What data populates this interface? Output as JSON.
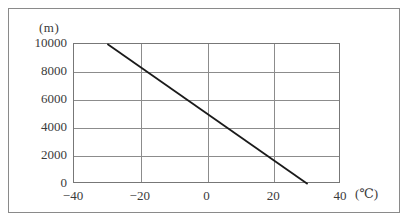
{
  "chart_data": {
    "type": "line",
    "title": "",
    "subtitle": "",
    "xlabel": "(℃)",
    "ylabel": "(m)",
    "xlim": [
      -40,
      40
    ],
    "ylim": [
      0,
      10000
    ],
    "xticks": [
      -40,
      -20,
      0,
      20,
      40
    ],
    "xtick_labels": [
      "−40",
      "−20",
      "0",
      "20",
      "40"
    ],
    "yticks": [
      0,
      2000,
      4000,
      6000,
      8000,
      10000
    ],
    "ytick_labels": [
      "0",
      "2000",
      "4000",
      "6000",
      "8000",
      "10000"
    ],
    "grid": true,
    "legend": null,
    "series": [
      {
        "name": "altitude-temperature",
        "color": "#1a1a1a",
        "points": [
          {
            "x": -30,
            "y": 10000
          },
          {
            "x": 30,
            "y": 0
          }
        ]
      }
    ],
    "annotations": []
  },
  "axes": {
    "y_unit_caption": "(m)",
    "x_unit_caption": "(℃)"
  },
  "colors": {
    "line": "#1a1a1a",
    "grid": "#8c8c8c",
    "plot_border": "#777777",
    "outer_frame": "#8a8a8a",
    "text": "#3a3a3a",
    "background": "#ffffff"
  }
}
